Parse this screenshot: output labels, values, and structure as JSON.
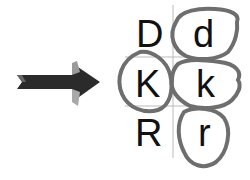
{
  "diagram": {
    "arrow": {
      "icon": "right-arrow-icon",
      "direction": "right",
      "color": "#2b2b2b",
      "highlight": "#9a9a9a"
    },
    "grid": {
      "line_color": "#bbbbbb"
    },
    "letters": [
      {
        "id": "D",
        "label": "D",
        "row": 0,
        "col": 0,
        "circled": false
      },
      {
        "id": "d",
        "label": "d",
        "row": 0,
        "col": 1,
        "circled": true
      },
      {
        "id": "K",
        "label": "K",
        "row": 1,
        "col": 0,
        "circled": true
      },
      {
        "id": "k",
        "label": "k",
        "row": 1,
        "col": 1,
        "circled": true
      },
      {
        "id": "R",
        "label": "R",
        "row": 2,
        "col": 0,
        "circled": false
      },
      {
        "id": "r",
        "label": "r",
        "row": 2,
        "col": 1,
        "circled": true
      }
    ],
    "circle_color": "#6e6e6e"
  }
}
